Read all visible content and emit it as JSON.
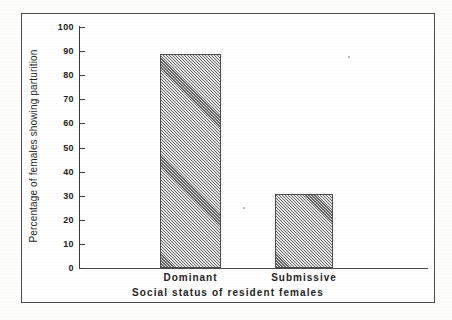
{
  "chart_data": {
    "type": "bar",
    "title": "",
    "subtitle": "",
    "xlabel": "Social status of resident females",
    "ylabel": "Percentage of females showing parturition",
    "categories": [
      "Dominant",
      "Submissive"
    ],
    "values": [
      89,
      30.5
    ],
    "ylim": [
      0,
      100
    ],
    "yticks": [
      0,
      10,
      20,
      30,
      40,
      50,
      60,
      70,
      80,
      90,
      100
    ],
    "ytick_labels": [
      "0",
      "10",
      "20",
      "30",
      "40",
      "50",
      "60",
      "70",
      "80",
      "90",
      "100"
    ],
    "grid": false,
    "legend": null,
    "legend_position": "none",
    "annotations": [],
    "bar_fill": "diagonal-hatch",
    "colors": {
      "bar_fill": "#a8a8a8",
      "bar_edge": "#4d4d4d",
      "axis": "#3a3a3a",
      "text": "#242424",
      "frame": "#4a4a4a",
      "background": "#ffffff"
    }
  },
  "figure": {
    "frame_visible": true,
    "background": "#ffffff"
  }
}
